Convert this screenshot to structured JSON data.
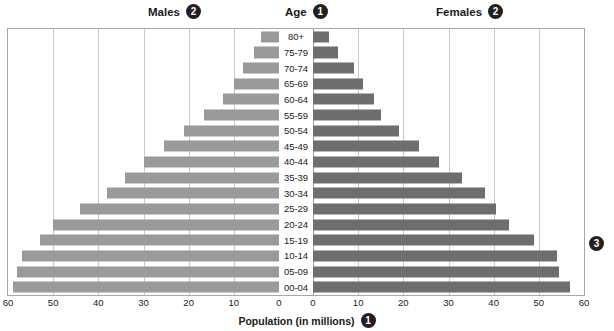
{
  "header": {
    "males_label": "Males",
    "males_badge": "2",
    "age_label": "Age",
    "age_badge": "1",
    "females_label": "Females",
    "females_badge": "2"
  },
  "callouts": {
    "right_badge": "3"
  },
  "axis": {
    "title": "Population (in millions)",
    "title_badge": "1",
    "tick_labels": [
      "60",
      "50",
      "40",
      "30",
      "20",
      "10",
      "0",
      "0",
      "10",
      "20",
      "30",
      "40",
      "50",
      "60"
    ]
  },
  "colors": {
    "male_bar": "#9a9a9a",
    "female_bar": "#6e6e6e",
    "gridline": "#c9c9c9",
    "frame": "#a8a8a8",
    "badge_bg": "#231f20",
    "badge_text": "#ffffff"
  },
  "chart_data": {
    "type": "bar",
    "xlabel": "Population (in millions)",
    "ylabel": "Age",
    "orientation": "horizontal",
    "layout": "population-pyramid",
    "grid": true,
    "legend_position": "top",
    "xlim_left": [
      60,
      0
    ],
    "xlim_right": [
      0,
      60
    ],
    "xticks": [
      0,
      10,
      20,
      30,
      40,
      50,
      60
    ],
    "categories": [
      "80+",
      "75-79",
      "70-74",
      "65-69",
      "60-64",
      "55-59",
      "50-54",
      "45-49",
      "40-44",
      "35-39",
      "30-34",
      "25-29",
      "20-24",
      "15-19",
      "10-14",
      "05-09",
      "00-04"
    ],
    "series": [
      {
        "name": "Males",
        "direction": "left",
        "color": "#9a9a9a",
        "values": [
          4,
          5.5,
          8,
          10,
          12.5,
          16.5,
          21,
          25.5,
          30,
          34,
          38,
          44,
          50,
          53,
          57,
          58,
          59
        ]
      },
      {
        "name": "Females",
        "direction": "right",
        "color": "#6e6e6e",
        "values": [
          3.5,
          5.5,
          9,
          11,
          13.5,
          15,
          19,
          23.5,
          28,
          33,
          38,
          40.5,
          43.5,
          49,
          54,
          54.5,
          57
        ]
      }
    ]
  }
}
